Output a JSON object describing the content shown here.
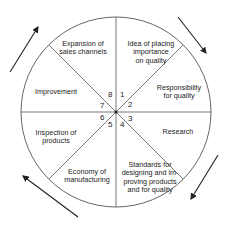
{
  "diagram": {
    "type": "cycle-wheel",
    "segments": [
      {
        "number": "1",
        "label": "Idea of placing\nimportance\non quality"
      },
      {
        "number": "2",
        "label": "Responsibility\nfor quality"
      },
      {
        "number": "3",
        "label": "Research"
      },
      {
        "number": "4",
        "label": "Standards for\ndesigning and im-\nproving products\nand for quality"
      },
      {
        "number": "5",
        "label": "Economy of\nmanufacturing"
      },
      {
        "number": "6",
        "label": "Inspection of\nproducts"
      },
      {
        "number": "7",
        "label": "Improvement"
      },
      {
        "number": "8",
        "label": "Expansion of\nsales channels"
      }
    ],
    "direction": "clockwise",
    "colors": {
      "line": "#555555",
      "arrow": "#222222",
      "text": "#222222"
    }
  }
}
